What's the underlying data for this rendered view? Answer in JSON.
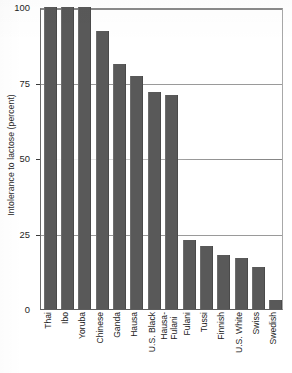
{
  "chart_data": {
    "type": "bar",
    "title": "",
    "xlabel": "",
    "ylabel": "Intolerance to lactose (percent)",
    "ylim": [
      0,
      100
    ],
    "yticks": [
      0,
      25,
      50,
      75,
      100
    ],
    "ytick_labels": [
      "0",
      "25",
      "50",
      "75",
      "100"
    ],
    "grid": "horizontal gridlines at 25, 50, 75, 100",
    "legend": "none",
    "orientation": "vertical",
    "bar_color": "#595959",
    "categories": [
      "Thai",
      "Ibo",
      "Yoruba",
      "Chinese",
      "Ganda",
      "Hausa",
      "U.S. Black",
      "Hausa-Fulani",
      "Fulani",
      "Tussi",
      "Finnish",
      "U.S. White",
      "Swiss",
      "Swedish"
    ],
    "values": [
      100,
      100,
      100,
      92,
      81,
      77,
      72,
      71,
      23,
      21,
      18,
      17,
      14,
      3
    ]
  },
  "axis": {
    "y_title": "Intolerance to lactose (percent)"
  },
  "x_labels": [
    {
      "line1": "Thai",
      "line2": ""
    },
    {
      "line1": "Ibo",
      "line2": ""
    },
    {
      "line1": "Yoruba",
      "line2": ""
    },
    {
      "line1": "Chinese",
      "line2": ""
    },
    {
      "line1": "Ganda",
      "line2": ""
    },
    {
      "line1": "Hausa",
      "line2": ""
    },
    {
      "line1": "U.S. Black",
      "line2": ""
    },
    {
      "line1": "Hausa-",
      "line2": "Fulani"
    },
    {
      "line1": "Fulani",
      "line2": ""
    },
    {
      "line1": "Tussi",
      "line2": ""
    },
    {
      "line1": "Finnish",
      "line2": ""
    },
    {
      "line1": "U.S. White",
      "line2": ""
    },
    {
      "line1": "Swiss",
      "line2": ""
    },
    {
      "line1": "Swedish",
      "line2": ""
    }
  ]
}
